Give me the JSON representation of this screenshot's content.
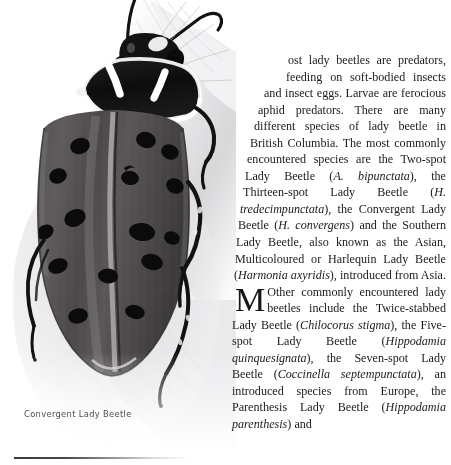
{
  "page": {
    "background": "#ffffff",
    "width": 451,
    "height": 465
  },
  "illustration": {
    "subject": "convergent-lady-beetle",
    "view": "dorsal",
    "style": "grayscale-photograph",
    "caption": "Convergent Lady Beetle",
    "colors": {
      "elytra": "#4a4749",
      "pronotum": "#141414",
      "spots": "#0d0d0d",
      "markings": "#fbfbfb",
      "background": "#ffffff",
      "shadow": "#c9c9cb"
    },
    "elytra_spot_count": 12
  },
  "caption": {
    "text": "Convergent Lady Beetle",
    "color": "#4e4e50"
  },
  "rule": {
    "color_start": "#3a3a3a",
    "color_end": "#ffffff"
  },
  "article": {
    "dropcap": "M",
    "paragraph_parts": [
      {
        "text": "ost lady beetles are predators, feeding on soft-bodied insects and insect eggs. Larvae are ferocious aphid predators. There are many different species of lady beetle in British Columbia. The most commonly encountered species are the Two-spot Lady Beetle (",
        "style": "roman"
      },
      {
        "text": "A. bipunctata",
        "style": "italic"
      },
      {
        "text": "), the Thirteen-spot Lady Beetle (",
        "style": "roman"
      },
      {
        "text": "H. tredecimpunctata",
        "style": "italic"
      },
      {
        "text": "), the Convergent Lady Beetle (",
        "style": "roman"
      },
      {
        "text": "H. convergens",
        "style": "italic"
      },
      {
        "text": ") and the Southern Lady Beetle, also known as the Asian, Multicoloured or Harlequin Lady Beetle (",
        "style": "roman"
      },
      {
        "text": "Harmonia axyridis",
        "style": "italic"
      },
      {
        "text": "), introduced from Asia. Other commonly encountered lady beetles include the Twice-stabbed Lady Beetle (",
        "style": "roman"
      },
      {
        "text": "Chilocorus stigma",
        "style": "italic"
      },
      {
        "text": "), the Five-spot Lady Beetle (",
        "style": "roman"
      },
      {
        "text": "Hippodamia quinquesignata",
        "style": "italic"
      },
      {
        "text": "), the Seven-spot Lady Beetle (",
        "style": "roman"
      },
      {
        "text": "Coccinella septempunctata",
        "style": "italic"
      },
      {
        "text": "), an introduced species from Europe, the Parenthesis Lady Beetle (",
        "style": "roman"
      },
      {
        "text": "Hippodamia parenthesis",
        "style": "italic"
      },
      {
        "text": ") and",
        "style": "roman"
      }
    ],
    "species_mentioned": [
      "Two-spot Lady Beetle (A. bipunctata)",
      "Thirteen-spot Lady Beetle (H. tredecimpunctata)",
      "Convergent Lady Beetle (H. convergens)",
      "Southern Lady Beetle / Asian, Multicoloured or Harlequin Lady Beetle (Harmonia axyridis)",
      "Twice-stabbed Lady Beetle (Chilocorus stigma)",
      "Five-spot Lady Beetle (Hippodamia quinquesignata)",
      "Seven-spot Lady Beetle (Coccinella septempunctata)",
      "Parenthesis Lady Beetle (Hippodamia parenthesis)"
    ],
    "region_mentioned": "British Columbia",
    "text_color": "#1a1a1a"
  }
}
